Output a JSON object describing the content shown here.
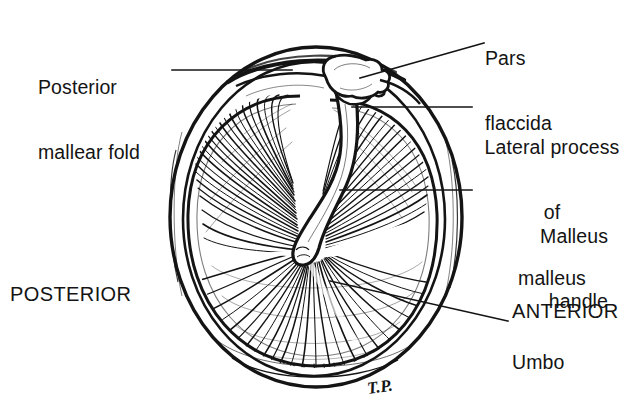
{
  "figure": {
    "signature": "T.P.",
    "ink_color": "#141414",
    "background_color": "#ffffff"
  },
  "labels": {
    "pars_flaccida": {
      "line1": "Pars",
      "line2": "flaccida"
    },
    "lateral_process": {
      "line1": "Lateral process",
      "line2": "of",
      "line3": "malleus"
    },
    "malleus_handle": {
      "line1": "Malleus",
      "line2": "handle"
    },
    "umbo": {
      "line1": "Umbo"
    },
    "posterior_mallear_fold": {
      "line1": "Posterior",
      "line2": "mallear fold"
    },
    "posterior": {
      "line1": "POSTERIOR"
    },
    "anterior": {
      "line1": "ANTERIOR"
    }
  }
}
